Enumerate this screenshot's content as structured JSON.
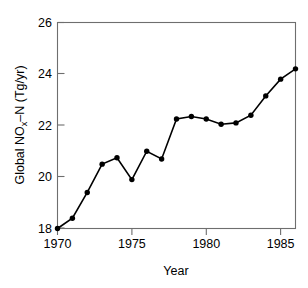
{
  "chart_data": {
    "type": "line",
    "title": "",
    "xlabel": "Year",
    "ylabel": "Global NOₓ–N (Tg/yr)",
    "ylabel_parts": {
      "prefix": "Global NO",
      "subscript": "x",
      "suffix": "–N (Tg/yr)"
    },
    "x": [
      1970,
      1971,
      1972,
      1973,
      1974,
      1975,
      1976,
      1977,
      1978,
      1979,
      1980,
      1981,
      1982,
      1983,
      1984,
      1985,
      1986
    ],
    "values": [
      18.0,
      18.4,
      19.4,
      20.5,
      20.75,
      19.9,
      21.0,
      20.7,
      22.25,
      22.35,
      22.25,
      22.05,
      22.1,
      22.4,
      23.15,
      23.8,
      24.2
    ],
    "xlim": [
      1970,
      1986
    ],
    "ylim": [
      18,
      26
    ],
    "xticks": [
      1970,
      1975,
      1980,
      1985
    ],
    "xtick_labels": [
      "1970",
      "1975",
      "1980",
      "1985"
    ],
    "yticks": [
      18,
      20,
      22,
      24,
      26
    ],
    "ytick_labels": [
      "18",
      "20",
      "22",
      "24",
      "26"
    ],
    "grid": false,
    "legend": false,
    "marker": "filled-circle",
    "line_color": "#000000",
    "marker_color": "#000000",
    "frame_color": "#6e6e6e",
    "background": "#ffffff"
  }
}
